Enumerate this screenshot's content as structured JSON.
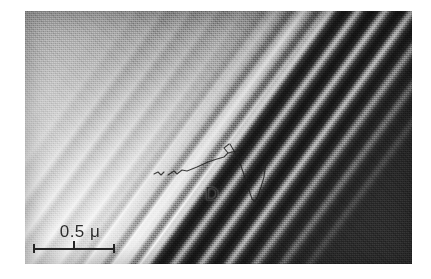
{
  "figure": {
    "kind": "tem-micrograph",
    "plate": {
      "x": 25,
      "y": 11,
      "width": 387,
      "height": 253
    },
    "regions": [
      {
        "name": "dark-crystal-region",
        "position": "upper-right",
        "color": "#2a2a2a"
      },
      {
        "name": "bright-wedge-region",
        "position": "lower-left",
        "color": "#f5f5f5"
      },
      {
        "name": "thickness-fringe-band",
        "position": "diagonal",
        "orientation_deg": -36
      }
    ],
    "fringes": {
      "count": 9,
      "spacing_px": 11,
      "angle_deg": -36
    }
  },
  "annotations": {
    "dislocation_label": "D",
    "dislocation_label_position": {
      "x": 205,
      "y": 187
    }
  },
  "scale_bar": {
    "value": "0.5",
    "unit": "μ",
    "label": "0.5 μ",
    "bar_length_px": 82,
    "ticks": 3
  },
  "colors": {
    "dark_matrix": "#2a2a2a",
    "bright_wedge": "#f5f5f5",
    "mid_gray": "#a8a8a8",
    "ink": "#242424",
    "page_background": "#ffffff"
  }
}
